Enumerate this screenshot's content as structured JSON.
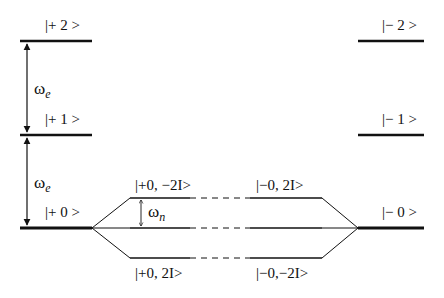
{
  "levels": {
    "plus_2": "|+ 2 >",
    "plus_1": "|+ 1 >",
    "plus_0": "|+ 0 >",
    "minus_2": "|− 2 >",
    "minus_1": "|− 1 >",
    "minus_0": "|− 0 >"
  },
  "sublevels": {
    "plus0_minus2I": "|+0, −2I>",
    "plus0_plus2I": "|+0, 2I>",
    "minus0_plus2I": "|−0, 2I>",
    "minus0_minus2I": "|−0,−2I>"
  },
  "splittings": {
    "electronic_symbol": "ω",
    "electronic_subscript": "e",
    "nuclear_symbol": "ω",
    "nuclear_subscript": "n"
  },
  "colors": {
    "line": "#111111",
    "background": "#ffffff"
  }
}
